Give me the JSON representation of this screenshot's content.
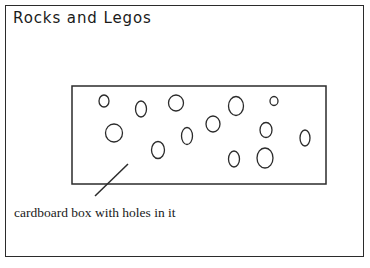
{
  "figure": {
    "title": "Rocks and Legos",
    "caption": "cardboard box with holes in it",
    "stroke_color": "#2b2b2b",
    "background_color": "#ffffff",
    "outer_frame": {
      "x": 5,
      "y": 5,
      "width": 359,
      "height": 252
    },
    "box": {
      "label": "cardboard box",
      "x": 72,
      "y": 86,
      "width": 254,
      "height": 98
    },
    "leader_line": {
      "x1": 95,
      "y1": 196,
      "x2": 128,
      "y2": 164
    },
    "holes_count": 16,
    "holes": [
      {
        "cx": 104,
        "cy": 101,
        "rx": 5.0,
        "ry": 6.0
      },
      {
        "cx": 141,
        "cy": 109,
        "rx": 5.5,
        "ry": 8.0
      },
      {
        "cx": 176,
        "cy": 103,
        "rx": 7.5,
        "ry": 8.0
      },
      {
        "cx": 236,
        "cy": 106,
        "rx": 7.5,
        "ry": 9.5
      },
      {
        "cx": 274,
        "cy": 101,
        "rx": 4.0,
        "ry": 4.5
      },
      {
        "cx": 114,
        "cy": 133,
        "rx": 8.5,
        "ry": 9.0
      },
      {
        "cx": 213,
        "cy": 124,
        "rx": 7.0,
        "ry": 8.0
      },
      {
        "cx": 266,
        "cy": 130,
        "rx": 6.0,
        "ry": 7.5
      },
      {
        "cx": 187,
        "cy": 136,
        "rx": 5.5,
        "ry": 8.5
      },
      {
        "cx": 158,
        "cy": 150,
        "rx": 6.5,
        "ry": 8.5
      },
      {
        "cx": 305,
        "cy": 138,
        "rx": 5.0,
        "ry": 8.0
      },
      {
        "cx": 234,
        "cy": 159,
        "rx": 5.5,
        "ry": 8.0
      },
      {
        "cx": 265,
        "cy": 158,
        "rx": 8.0,
        "ry": 10.0
      }
    ]
  }
}
